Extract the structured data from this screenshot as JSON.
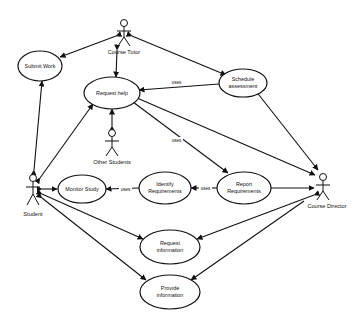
{
  "diagram": {
    "type": "UML use case diagram",
    "actors": [
      {
        "id": "course_tutor",
        "label": "Course Tutor"
      },
      {
        "id": "other_students",
        "label": "Other Students"
      },
      {
        "id": "student",
        "label": "Student"
      },
      {
        "id": "course_director",
        "label": "Course Director"
      }
    ],
    "use_cases": [
      {
        "id": "submit_work",
        "lines": [
          "Submit Work"
        ]
      },
      {
        "id": "request_help",
        "lines": [
          "Request help"
        ]
      },
      {
        "id": "schedule_assessment",
        "lines": [
          "Schedule",
          "assessment"
        ]
      },
      {
        "id": "monitor_study",
        "lines": [
          "Monitor Study"
        ]
      },
      {
        "id": "identify_requirements",
        "lines": [
          "Identify",
          "Requirements"
        ]
      },
      {
        "id": "report_requirements",
        "lines": [
          "Report",
          "Requirements"
        ]
      },
      {
        "id": "request_information",
        "lines": [
          "Request",
          "information"
        ]
      },
      {
        "id": "provide_information",
        "lines": [
          "Provide",
          "information"
        ]
      }
    ],
    "relations": [
      {
        "from": "course_tutor",
        "to": "submit_work",
        "label": ""
      },
      {
        "from": "course_tutor",
        "to": "request_help",
        "label": ""
      },
      {
        "from": "course_tutor",
        "to": "schedule_assessment",
        "label": ""
      },
      {
        "from": "student",
        "to": "submit_work",
        "label": ""
      },
      {
        "from": "student",
        "to": "request_help",
        "label": ""
      },
      {
        "from": "other_students",
        "to": "request_help",
        "label": ""
      },
      {
        "from": "schedule_assessment",
        "to": "request_help",
        "label": "uses"
      },
      {
        "from": "request_help",
        "to": "report_requirements",
        "label": "uses"
      },
      {
        "from": "request_help",
        "to": "course_director",
        "label": ""
      },
      {
        "from": "schedule_assessment",
        "to": "course_director",
        "label": ""
      },
      {
        "from": "student",
        "to": "monitor_study",
        "label": ""
      },
      {
        "from": "identify_requirements",
        "to": "monitor_study",
        "label": "uses"
      },
      {
        "from": "report_requirements",
        "to": "identify_requirements",
        "label": "uses"
      },
      {
        "from": "report_requirements",
        "to": "course_director",
        "label": ""
      },
      {
        "from": "student",
        "to": "request_information",
        "label": ""
      },
      {
        "from": "student",
        "to": "provide_information",
        "label": ""
      },
      {
        "from": "course_director",
        "to": "request_information",
        "label": ""
      },
      {
        "from": "course_director",
        "to": "provide_information",
        "label": ""
      },
      {
        "from": "student",
        "to": "course_director",
        "label": ""
      }
    ],
    "uses_label": "uses"
  }
}
